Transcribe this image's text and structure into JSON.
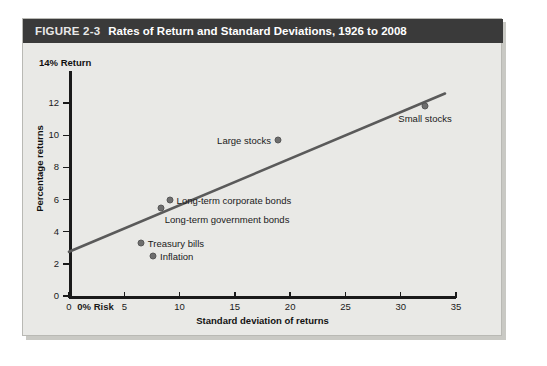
{
  "figure": {
    "number": "FIGURE 2-3",
    "title": "Rates of Return and Standard Deviations, 1926 to 2008"
  },
  "colors": {
    "title_bar": "#3a3a3a",
    "panel_background": "#e9e9e6",
    "line": "#5a5a5a",
    "marker": "#6e6e6e",
    "axis": "#1a1a1a"
  },
  "chart_data": {
    "type": "scatter",
    "title": "Rates of Return and Standard Deviations, 1926 to 2008",
    "xlabel": "Standard deviation of returns",
    "ylabel": "Percentage returns",
    "y_top_label": "14% Return",
    "x_origin_label": "0% Risk",
    "xlim": [
      0,
      35
    ],
    "ylim": [
      0,
      14
    ],
    "xticks": [
      0,
      5,
      10,
      15,
      20,
      25,
      30,
      35
    ],
    "xticklabels": [
      "0",
      "0% Risk",
      "5",
      "10",
      "15",
      "20",
      "25",
      "30",
      "35"
    ],
    "yticks": [
      0,
      2,
      4,
      6,
      8,
      10,
      12
    ],
    "yticklabels": [
      "0",
      "2",
      "4",
      "6",
      "8",
      "10",
      "12"
    ],
    "grid": false,
    "legend": "none",
    "points": [
      {
        "name": "Treasury bills",
        "x": 6.5,
        "y": 3.3,
        "label_pos": "right"
      },
      {
        "name": "Inflation",
        "x": 7.6,
        "y": 2.5,
        "label_pos": "right"
      },
      {
        "name": "Long-term government bonds",
        "x": 8.3,
        "y": 5.5,
        "label_pos": "below-right"
      },
      {
        "name": "Long-term corporate bonds",
        "x": 9.1,
        "y": 6.0,
        "label_pos": "right"
      },
      {
        "name": "Large stocks",
        "x": 18.9,
        "y": 9.7,
        "label_pos": "left"
      },
      {
        "name": "Small stocks",
        "x": 32.2,
        "y": 11.8,
        "label_pos": "below"
      }
    ],
    "trendline": {
      "x_start": 0,
      "y_start": 2.75,
      "x_end": 34.0,
      "y_end": 12.6
    }
  }
}
